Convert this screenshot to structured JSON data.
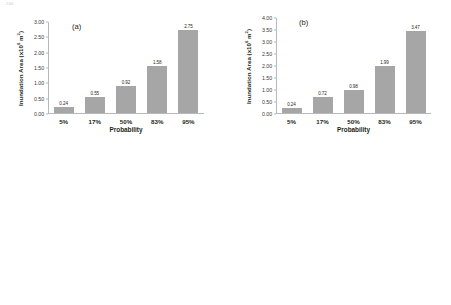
{
  "page_mark": "246",
  "axis": {
    "xlabel": "Probability",
    "ylabel_prefix": "Inundation Area (x10",
    "ylabel_exponent": "6",
    "ylabel_suffix": " m",
    "ylabel_unit_exponent": "2",
    "ylabel_close": ")",
    "categories": [
      "5%",
      "17%",
      "50%",
      "83%",
      "95%"
    ]
  },
  "colors": {
    "bar": "#a6a6a6",
    "axis": "#b8b8b8",
    "text": "#231f20"
  },
  "chart_data": [
    {
      "type": "bar",
      "panel": "(a)",
      "title": "",
      "xlabel": "Probability",
      "ylabel": "Inundation Area (x10^6 m^2)",
      "categories": [
        "5%",
        "17%",
        "50%",
        "83%",
        "95%"
      ],
      "values": [
        0.24,
        0.55,
        0.92,
        1.58,
        2.75
      ],
      "value_labels": [
        "0.24",
        "0.55",
        "0.92",
        "1.58",
        "2.75"
      ],
      "ylim": [
        0.0,
        3.0
      ],
      "yticks": [
        "0.00",
        "0.50",
        "1.00",
        "1.50",
        "2.00",
        "2.50",
        "3.00"
      ],
      "ytick_values": [
        0.0,
        0.5,
        1.0,
        1.5,
        2.0,
        2.5,
        3.0
      ],
      "grid": false,
      "legend": "none"
    },
    {
      "type": "bar",
      "panel": "(b)",
      "title": "",
      "xlabel": "Probability",
      "ylabel": "Inundation Area (x10^6 m^2)",
      "categories": [
        "5%",
        "17%",
        "50%",
        "83%",
        "95%"
      ],
      "values": [
        0.24,
        0.72,
        0.98,
        1.99,
        3.47
      ],
      "value_labels": [
        "0.24",
        "0.72",
        "0.98",
        "1.99",
        "3.47"
      ],
      "ylim": [
        0.0,
        4.0
      ],
      "yticks": [
        "0.00",
        "0.50",
        "1.00",
        "1.50",
        "2.00",
        "2.50",
        "3.00",
        "3.50",
        "4.00"
      ],
      "ytick_values": [
        0.0,
        0.5,
        1.0,
        1.5,
        2.0,
        2.5,
        3.0,
        3.5,
        4.0
      ],
      "grid": false,
      "legend": "none"
    },
    {
      "type": "bar",
      "panel": "(c)",
      "title": "",
      "xlabel": "Probability",
      "ylabel": "Inundation Area (x10^6 m^2)",
      "categories": [
        "5%",
        "17%",
        "50%",
        "83%",
        "95%"
      ],
      "values": [
        0.91,
        1.96,
        8.95,
        25.61,
        49.89
      ],
      "value_labels": [
        "0.91",
        "1.96",
        "8.95",
        "25.61",
        "49.89"
      ],
      "ylim": [
        0.0,
        60.0
      ],
      "yticks": [
        "0.00",
        "10.00",
        "20.00",
        "30.00",
        "40.00",
        "50.00",
        "60.00"
      ],
      "ytick_values": [
        0.0,
        10.0,
        20.0,
        30.0,
        40.0,
        50.0,
        60.0
      ],
      "grid": false,
      "legend": "none"
    },
    {
      "type": "bar",
      "panel": "(d)",
      "title": "",
      "xlabel": "Probability",
      "ylabel": "Inundation Area (x10^6 m^2)",
      "categories": [
        "5%",
        "17%",
        "50%",
        "83%",
        "95%"
      ],
      "values": [
        1.29,
        4.25,
        16.52,
        50.55,
        73.67
      ],
      "value_labels": [
        "1.29",
        "4.25",
        "16.52",
        "50.55",
        "73.67"
      ],
      "ylim": [
        0.0,
        80.0
      ],
      "yticks": [
        "0.00",
        "10.00",
        "20.00",
        "30.00",
        "40.00",
        "50.00",
        "60.00",
        "70.00",
        "80.00"
      ],
      "ytick_values": [
        0.0,
        10.0,
        20.0,
        30.0,
        40.0,
        50.0,
        60.0,
        70.0,
        80.0
      ],
      "grid": false,
      "legend": "none"
    }
  ]
}
